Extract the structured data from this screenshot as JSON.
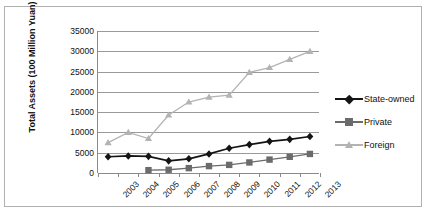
{
  "chart_data": {
    "type": "line",
    "title": "",
    "xlabel": "",
    "ylabel": "Total Assets (100 Million Yuan)",
    "categories": [
      "2003",
      "2004",
      "2005",
      "2006",
      "2007",
      "2008",
      "2009",
      "2010",
      "2011",
      "2012",
      "2013"
    ],
    "ylim": [
      0,
      35000
    ],
    "ytick_step": 5000,
    "yticks": [
      "35000",
      "30000",
      "25000",
      "20000",
      "15000",
      "10000",
      "5000",
      "0"
    ],
    "ytick_values": [
      35000,
      30000,
      25000,
      20000,
      15000,
      10000,
      5000,
      0
    ],
    "grid": true,
    "legend_position": "right",
    "series": [
      {
        "name": "State-owned",
        "color": "#141414",
        "marker": "diamond",
        "values": [
          4000,
          4200,
          4100,
          3000,
          3500,
          4700,
          6100,
          7000,
          7800,
          8300,
          9000
        ]
      },
      {
        "name": "Private",
        "color": "#6b6b6b",
        "marker": "square",
        "values": [
          null,
          null,
          700,
          800,
          1200,
          1700,
          2000,
          2600,
          3300,
          4000,
          4700
        ]
      },
      {
        "name": "Foreign",
        "color": "#b3b3b3",
        "marker": "triangle",
        "values": [
          7500,
          10000,
          8500,
          14300,
          17500,
          18700,
          19200,
          24800,
          26000,
          28000,
          30000
        ]
      }
    ]
  },
  "colors": {
    "state_owned": "#141414",
    "private": "#6b6b6b",
    "foreign": "#b3b3b3",
    "grid": "#9a9a9a",
    "frame": "#b0b0b0"
  }
}
